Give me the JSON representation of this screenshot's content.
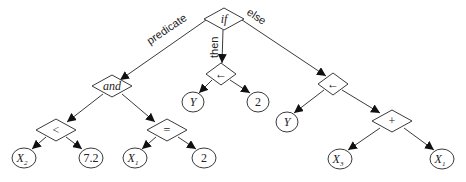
{
  "diagram": {
    "type": "expression-tree",
    "root": "if",
    "edge_labels": {
      "predicate": "predicate",
      "then": "then",
      "else": "else"
    },
    "nodes": {
      "if": {
        "label": "if",
        "shape": "diamond"
      },
      "and": {
        "label": "and",
        "shape": "diamond"
      },
      "lt": {
        "label": "<",
        "shape": "diamond"
      },
      "eq": {
        "label": "=",
        "shape": "diamond"
      },
      "assign_then": {
        "label": "←",
        "shape": "diamond"
      },
      "assign_else": {
        "label": "←",
        "shape": "diamond"
      },
      "plus": {
        "label": "+",
        "shape": "diamond"
      },
      "x2": {
        "label": "X",
        "sub": "2",
        "shape": "ellipse"
      },
      "c72": {
        "label": "7.2",
        "shape": "ellipse"
      },
      "x1a": {
        "label": "X",
        "sub": "1",
        "shape": "ellipse"
      },
      "c2a": {
        "label": "2",
        "shape": "ellipse"
      },
      "y_then": {
        "label": "Y",
        "shape": "ellipse"
      },
      "c2b": {
        "label": "2",
        "shape": "ellipse"
      },
      "y_else": {
        "label": "Y",
        "shape": "ellipse"
      },
      "x3": {
        "label": "X",
        "sub": "3",
        "shape": "ellipse"
      },
      "x1b": {
        "label": "X",
        "sub": "1",
        "shape": "ellipse"
      }
    },
    "edges": [
      {
        "from": "if",
        "to": "and",
        "label": "predicate"
      },
      {
        "from": "if",
        "to": "assign_then",
        "label": "then"
      },
      {
        "from": "if",
        "to": "assign_else",
        "label": "else"
      },
      {
        "from": "and",
        "to": "lt"
      },
      {
        "from": "and",
        "to": "eq"
      },
      {
        "from": "lt",
        "to": "x2"
      },
      {
        "from": "lt",
        "to": "c72"
      },
      {
        "from": "eq",
        "to": "x1a"
      },
      {
        "from": "eq",
        "to": "c2a"
      },
      {
        "from": "assign_then",
        "to": "y_then"
      },
      {
        "from": "assign_then",
        "to": "c2b"
      },
      {
        "from": "assign_else",
        "to": "y_else"
      },
      {
        "from": "assign_else",
        "to": "plus"
      },
      {
        "from": "plus",
        "to": "x3"
      },
      {
        "from": "plus",
        "to": "x1b"
      }
    ]
  }
}
